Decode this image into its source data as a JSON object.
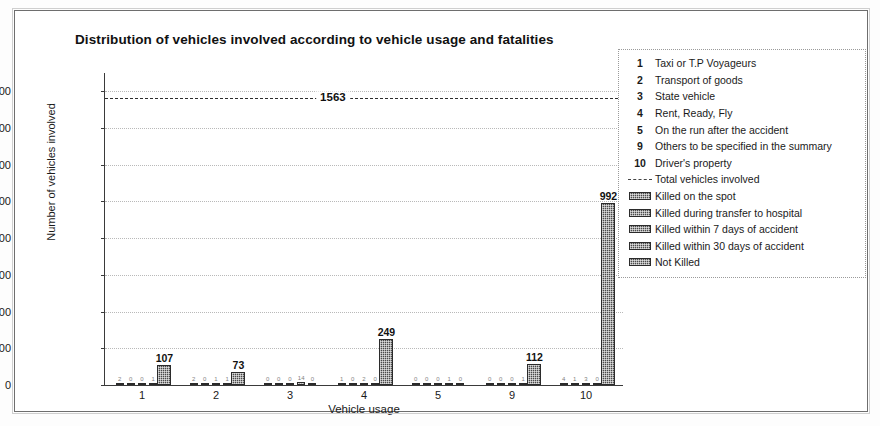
{
  "chart_data": {
    "type": "bar",
    "title": "Distribution of vehicles involved according to vehicle usage and fatalities",
    "xlabel": "Vehicle usage",
    "ylabel": "Number of vehicles involved",
    "ylim": [
      0,
      1700
    ],
    "yticks": [
      0,
      200,
      400,
      600,
      800,
      1000,
      1200,
      1400,
      1600
    ],
    "grid": true,
    "legend_position": "right-outside",
    "categories": [
      "1",
      "2",
      "3",
      "4",
      "5",
      "9",
      "10"
    ],
    "series": [
      {
        "name": "Killed on the spot",
        "values": [
          2,
          2,
          0,
          1,
          0,
          0,
          4
        ]
      },
      {
        "name": "Killed during transfer to hospital",
        "values": [
          0,
          0,
          0,
          0,
          0,
          0,
          1
        ]
      },
      {
        "name": "Killed within 7 days of accident",
        "values": [
          0,
          1,
          0,
          2,
          0,
          0,
          3
        ]
      },
      {
        "name": "Killed within 30 days of accident",
        "values": [
          1,
          1,
          14,
          0,
          1,
          1,
          0
        ]
      },
      {
        "name": "Not Killed",
        "values": [
          107,
          73,
          0,
          249,
          0,
          112,
          992
        ]
      }
    ],
    "annotation": {
      "label": "Total vehicles involved",
      "value": 1563,
      "value_text": "1563",
      "style": "dashed-horizontal-line"
    },
    "bar_value_labels": [
      "107",
      "73",
      "249",
      "112",
      "992"
    ]
  },
  "legend": {
    "numbered_entries": [
      {
        "key": "1",
        "label": "Taxi or T.P Voyageurs"
      },
      {
        "key": "2",
        "label": "Transport of goods"
      },
      {
        "key": "3",
        "label": "State vehicle"
      },
      {
        "key": "4",
        "label": "Rent, Ready, Fly"
      },
      {
        "key": "5",
        "label": "On the run after the accident"
      },
      {
        "key": "9",
        "label": "Others to be specified in the summary"
      },
      {
        "key": "10",
        "label": "Driver's property"
      }
    ],
    "symbol_entries": [
      {
        "swatch": "dashed-line",
        "label": "Total vehicles involved"
      },
      {
        "swatch": "hatch-box",
        "label": "Killed on the spot"
      },
      {
        "swatch": "hatch-box",
        "label": "Killed during transfer to hospital"
      },
      {
        "swatch": "hatch-box",
        "label": "Killed within 7 days of accident"
      },
      {
        "swatch": "hatch-box",
        "label": "Killed within 30 days of accident"
      },
      {
        "swatch": "hatch-box",
        "label": "Not Killed"
      }
    ]
  },
  "colors": {
    "bar_fill": "#4a4a4a",
    "axis": "#3a3a3a",
    "grid": "#b9b9b9",
    "frame": "#6e6e6e",
    "text": "#1a1a1a"
  }
}
